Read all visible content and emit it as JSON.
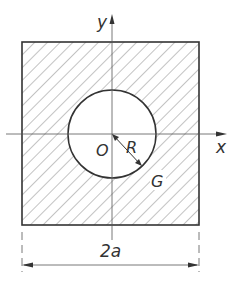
{
  "diagram": {
    "type": "geometry",
    "labels": {
      "y_axis": "y",
      "x_axis": "x",
      "origin": "O",
      "radius": "R",
      "region": "G",
      "dimension": "2a"
    },
    "colors": {
      "stroke": "#333333",
      "hatch": "#777777",
      "background": "#ffffff"
    }
  }
}
